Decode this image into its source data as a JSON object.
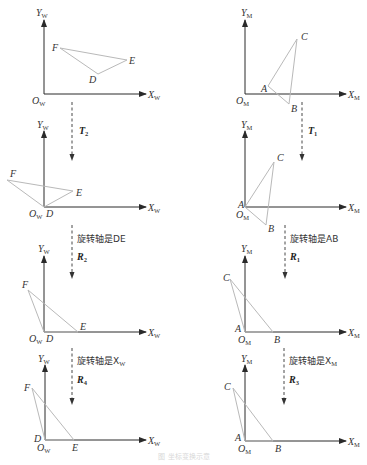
{
  "figure": {
    "caption": "图 坐标变换示意",
    "left_column": {
      "frame": "W",
      "axis_labels": {
        "x": "X",
        "y": "Y",
        "origin": "O",
        "subscript": "W"
      },
      "panels": [
        {
          "vertices": [
            "F",
            "E",
            "D"
          ]
        },
        {
          "vertices": [
            "F",
            "E",
            "D"
          ]
        },
        {
          "vertices": [
            "F",
            "E",
            "D"
          ]
        },
        {
          "vertices": [
            "F",
            "E",
            "D"
          ]
        }
      ],
      "transitions": [
        {
          "op": "T",
          "op_sub": "2",
          "note": ""
        },
        {
          "op": "R",
          "op_sub": "2",
          "note": "旋转轴是DE"
        },
        {
          "op": "R",
          "op_sub": "4",
          "note": "旋转轴是X",
          "note_sub": "W"
        }
      ]
    },
    "right_column": {
      "frame": "M",
      "axis_labels": {
        "x": "X",
        "y": "Y",
        "origin": "O",
        "subscript": "M"
      },
      "panels": [
        {
          "vertices": [
            "A",
            "B",
            "C"
          ]
        },
        {
          "vertices": [
            "A",
            "B",
            "C"
          ]
        },
        {
          "vertices": [
            "A",
            "B",
            "C"
          ]
        },
        {
          "vertices": [
            "A",
            "B",
            "C"
          ]
        }
      ],
      "transitions": [
        {
          "op": "T",
          "op_sub": "1",
          "note": ""
        },
        {
          "op": "R",
          "op_sub": "1",
          "note": "旋转轴是AB"
        },
        {
          "op": "R",
          "op_sub": "3",
          "note": "旋转轴是X",
          "note_sub": "M"
        }
      ]
    },
    "colors": {
      "axis": "#2a2a2a",
      "triangle": "#b9b9b9",
      "text": "#333333"
    }
  }
}
